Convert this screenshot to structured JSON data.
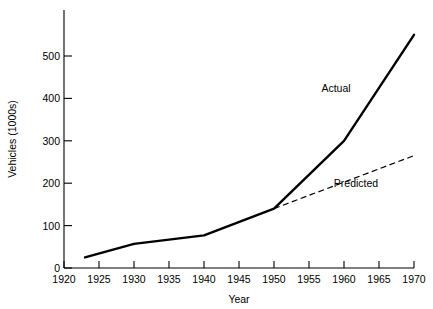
{
  "chart_data": {
    "type": "line",
    "title": "",
    "xlabel": "Year",
    "ylabel": "Vehicles (1000s)",
    "xlim": [
      1920,
      1970
    ],
    "ylim": [
      0,
      560
    ],
    "xticks": [
      1920,
      1925,
      1930,
      1935,
      1940,
      1945,
      1950,
      1955,
      1960,
      1965,
      1970
    ],
    "yticks": [
      0,
      100,
      200,
      300,
      400,
      500
    ],
    "grid": false,
    "legend_position": "inline-annotation",
    "series": [
      {
        "name": "Actual",
        "style": "solid",
        "x": [
          1923,
          1930,
          1940,
          1950,
          1960,
          1970
        ],
        "values": [
          25,
          57,
          77,
          140,
          300,
          550
        ]
      },
      {
        "name": "Predicted",
        "style": "dashed",
        "x": [
          1950,
          1970
        ],
        "values": [
          140,
          265
        ]
      }
    ],
    "annotations": [
      {
        "text": "Actual",
        "x": 1958,
        "y": 400
      },
      {
        "text": "Predicted",
        "x": 1962,
        "y": 185
      }
    ]
  },
  "axis": {
    "y_title": "Vehicles (1000s)",
    "x_title": "Year",
    "y_tick_labels": [
      "0",
      "100",
      "200",
      "300",
      "400",
      "500"
    ],
    "x_tick_labels": [
      "1920",
      "1925",
      "1930",
      "1935",
      "1940",
      "1945",
      "1950",
      "1955",
      "1960",
      "1965",
      "1970"
    ]
  },
  "labels": {
    "actual": "Actual",
    "predicted": "Predicted"
  },
  "colors": {
    "ink": "#000000",
    "background": "#ffffff"
  }
}
